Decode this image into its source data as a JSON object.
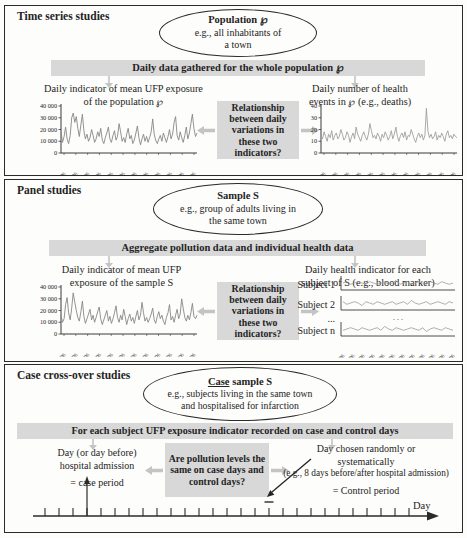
{
  "colors": {
    "gray_fill": "#d8d8d8",
    "connector_gray": "#c4c4c4",
    "axis": "#3a3a3a",
    "text": "#242424",
    "line_dark": "#878787",
    "line_light": "#9f9f9f"
  },
  "sections": [
    {
      "title": "Time series studies",
      "ellipse": {
        "title": "Population ℘",
        "line1": "e.g., all inhabitants of",
        "line2": "a town"
      },
      "bar": "Daily data gathered for the whole population ℘",
      "left_heading_1": "Daily indicator of mean UFP exposure",
      "left_heading_2": "of the population ℘",
      "right_heading_1": "Daily number of health",
      "right_heading_2": "events in ℘ (e.g., deaths)",
      "question": "Relationship between daily variations in these two indicators?"
    },
    {
      "title": "Panel studies",
      "ellipse": {
        "title": "Sample S",
        "line1": "e.g., group of adults living in",
        "line2": "the same town"
      },
      "bar": "Aggregate pollution data and individual health data",
      "left_heading_1": "Daily indicator of mean UFP",
      "left_heading_2": "exposure of the sample S",
      "right_heading_1": "Daily health indicator for each",
      "right_heading_2": "subject of S (e.g., blood marker)",
      "question": "Relationship between daily variations in these two indicators?"
    },
    {
      "title": "Case cross-over studies",
      "ellipse": {
        "title_underlined": "Case",
        "title_rest": " sample S",
        "line1": "e.g., subjects living in the same town",
        "line2": "and hospitalised for infarction"
      },
      "bar": "For each subject UFP exposure indicator recorded on case and control days",
      "left_line1": "Day (or day before)",
      "left_line2": "hospital admission",
      "left_tag": "= case period",
      "question": "Are pollution levels the same on case days and control days?",
      "right_line1": "Day chosen randomly or",
      "right_line2": "systematically",
      "right_line3": "(e.g., 8 days before/after hospital admission)",
      "right_line4": "= Control period"
    }
  ],
  "chart_data": [
    {
      "id": "ts_ufp",
      "type": "line",
      "title": "Daily indicator of mean UFP exposure of the population ℘",
      "ylim": [
        0,
        40000
      ],
      "ytick_values": [
        0,
        10000,
        20000,
        30000,
        40000
      ],
      "ytick_labels": [
        "0",
        "10 000",
        "20 000",
        "30 000",
        "40 000"
      ],
      "x_labels": [
        "01/01/06",
        "01/02/06",
        "01/03/06",
        "01/04/06",
        "01/05/06",
        "01/06/06",
        "01/07/06",
        "01/08/06",
        "01/09/06",
        "01/10/06",
        "01/11/06",
        "01/12/06"
      ],
      "color": "#878787",
      "values": [
        18000,
        9000,
        14000,
        22000,
        12000,
        8000,
        15000,
        30000,
        34000,
        26000,
        31000,
        21000,
        14000,
        24000,
        33000,
        19000,
        12000,
        16000,
        10000,
        13000,
        20000,
        15000,
        9000,
        12000,
        18000,
        14000,
        21000,
        11000,
        8000,
        13000,
        17000,
        22000,
        12000,
        9000,
        15000,
        19000,
        11000,
        14000,
        25000,
        18000,
        10000,
        13000,
        9000,
        16000,
        21000,
        12000,
        15000,
        8000,
        11000,
        17000,
        23000,
        13000,
        7000,
        12000,
        16000,
        10000,
        14000,
        9000,
        13000,
        18000,
        29000,
        16000,
        11000,
        8000,
        12000,
        15000,
        10000,
        17000,
        13000,
        9000,
        14000,
        20000,
        12000,
        16000,
        26000,
        31000,
        15000,
        11000,
        18000,
        13000,
        9000,
        15000,
        22000,
        12000,
        17000,
        25000,
        33000,
        21000,
        14000,
        17000
      ]
    },
    {
      "id": "ts_health",
      "type": "line",
      "title": "Daily number of health events in ℘ (e.g., deaths)",
      "ylim": [
        0,
        40
      ],
      "ytick_values": [
        0,
        10,
        20,
        30,
        40
      ],
      "ytick_labels": [
        "0",
        "10",
        "20",
        "30",
        "40"
      ],
      "x_labels": [
        "01/01/06",
        "01/02/06",
        "01/03/06",
        "01/04/06",
        "01/05/06",
        "01/06/06",
        "01/07/06",
        "01/08/06",
        "01/09/06",
        "01/10/06",
        "01/11/06",
        "01/12/06"
      ],
      "color": "#9f9f9f",
      "values": [
        15,
        12,
        18,
        14,
        10,
        16,
        13,
        19,
        11,
        15,
        17,
        12,
        14,
        20,
        16,
        11,
        13,
        18,
        15,
        9,
        14,
        17,
        12,
        22,
        16,
        13,
        10,
        15,
        18,
        14,
        11,
        16,
        25,
        19,
        13,
        15,
        12,
        17,
        14,
        10,
        16,
        13,
        18,
        15,
        11,
        14,
        19,
        12,
        16,
        22,
        14,
        10,
        15,
        17,
        13,
        18,
        11,
        15,
        14,
        20,
        16,
        12,
        9,
        14,
        17,
        13,
        16,
        11,
        15,
        38,
        18,
        13,
        16,
        12,
        14,
        18,
        11,
        15,
        13,
        17,
        14,
        10,
        16,
        19,
        13,
        15,
        12,
        16,
        14,
        13
      ]
    },
    {
      "id": "panel_ufp",
      "type": "line",
      "title": "Daily indicator of mean UFP exposure of the sample S",
      "ylim": [
        0,
        40000
      ],
      "ytick_values": [
        0,
        10000,
        20000,
        30000,
        40000
      ],
      "ytick_labels": [
        "0",
        "10 000",
        "20 000",
        "30 000",
        "40 000"
      ],
      "x_labels": [
        "01/01/06",
        "01/02/06",
        "01/03/06",
        "01/04/06",
        "01/05/06",
        "01/06/06",
        "01/07/06",
        "01/08/06",
        "01/09/06",
        "01/10/06",
        "01/11/06",
        "01/12/06"
      ],
      "color": "#878787",
      "values": [
        16000,
        10000,
        13000,
        25000,
        31000,
        18000,
        12000,
        22000,
        35000,
        27000,
        20000,
        14000,
        11000,
        19000,
        28000,
        15000,
        9000,
        13000,
        17000,
        21000,
        12000,
        16000,
        10000,
        14000,
        19000,
        23000,
        13000,
        8000,
        12000,
        16000,
        20000,
        11000,
        15000,
        9000,
        13000,
        18000,
        24000,
        14000,
        10000,
        16000,
        12000,
        21000,
        15000,
        8000,
        13000,
        17000,
        11000,
        14000,
        9000,
        15000,
        20000,
        12000,
        16000,
        27000,
        18000,
        11000,
        14000,
        10000,
        13000,
        17000,
        22000,
        12000,
        9000,
        15000,
        19000,
        13000,
        16000,
        11000,
        8000,
        14000,
        18000,
        25000,
        12000,
        15000,
        10000,
        16000,
        21000,
        13000,
        17000,
        30000,
        22000,
        14000,
        11000,
        16000,
        12000,
        18000,
        26000,
        15000,
        13000,
        16000
      ]
    },
    {
      "id": "subjects",
      "type": "subject-rows",
      "title": "Daily health indicator for each subject of S",
      "color": "#9a9a9a",
      "rows": [
        {
          "label": "Subject 1",
          "values": [
            0,
            1,
            -1,
            0,
            1,
            0,
            -1,
            1,
            0,
            -1,
            0,
            1,
            -1,
            0,
            2,
            -1,
            0,
            1,
            -1,
            0,
            1,
            0,
            -1,
            1,
            0,
            -1,
            1,
            0,
            -1,
            0
          ]
        },
        {
          "label": "Subject 2",
          "values": [
            1,
            -1,
            0,
            1,
            0,
            -2,
            1,
            0,
            -1,
            1,
            0,
            -1,
            0,
            1,
            -1,
            0,
            1,
            -1,
            2,
            0,
            -1,
            0,
            1,
            -1,
            0,
            1,
            0,
            -1,
            1,
            0
          ]
        },
        {
          "label": "...",
          "dots": true
        },
        {
          "label": "Subject n",
          "values": [
            -1,
            0,
            1,
            0,
            -1,
            1,
            0,
            -1,
            0,
            1,
            -1,
            2,
            0,
            -1,
            1,
            0,
            -1,
            0,
            1,
            0,
            -1,
            1,
            -2,
            0,
            1,
            0,
            -1,
            1,
            0,
            -1
          ]
        }
      ],
      "x_labels": [
        "01/01/06",
        "01/02/06",
        "01/03/06",
        "01/04/06",
        "01/05/06",
        "01/06/06",
        "01/07/06",
        "01/08/06",
        "01/09/06",
        "01/10/06",
        "01/11/06",
        "01/12/06"
      ]
    },
    {
      "id": "timeline",
      "type": "timeline",
      "tick_count": 27,
      "case_tick_index": 3,
      "control_tick_index": 16,
      "axis_label": "Day"
    }
  ]
}
